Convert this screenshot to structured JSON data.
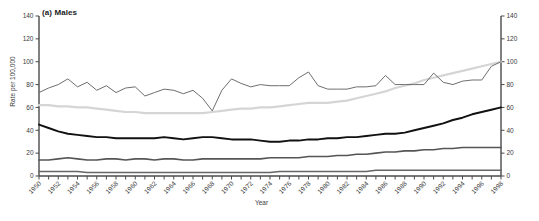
{
  "chart_data": {
    "type": "line",
    "title": "(a) Males",
    "xlabel": "Year",
    "ylabel": "Rate per 100,000",
    "xlim": [
      1950,
      1998
    ],
    "ylim": [
      0,
      140
    ],
    "ytick_values": [
      0,
      20,
      40,
      60,
      80,
      100,
      120,
      140
    ],
    "ytick_labels": [
      "0",
      "20",
      "40",
      "60",
      "80",
      "100",
      "120",
      "140"
    ],
    "right_axis": true,
    "right_ytick_labels": [
      "0",
      "20",
      "40",
      "60",
      "80",
      "100",
      "120",
      "140"
    ],
    "grid": false,
    "legend": "none",
    "x": [
      1950,
      1951,
      1952,
      1953,
      1954,
      1955,
      1956,
      1957,
      1958,
      1959,
      1960,
      1961,
      1962,
      1963,
      1964,
      1965,
      1966,
      1967,
      1968,
      1969,
      1970,
      1971,
      1972,
      1973,
      1974,
      1975,
      1976,
      1977,
      1978,
      1979,
      1980,
      1981,
      1982,
      1983,
      1984,
      1985,
      1986,
      1987,
      1988,
      1989,
      1990,
      1991,
      1992,
      1993,
      1994,
      1995,
      1996,
      1997,
      1998
    ],
    "xtick_values": [
      1950,
      1952,
      1954,
      1956,
      1958,
      1960,
      1962,
      1964,
      1966,
      1968,
      1970,
      1972,
      1974,
      1976,
      1978,
      1980,
      1982,
      1984,
      1986,
      1988,
      1990,
      1992,
      1994,
      1996,
      1998
    ],
    "xtick_labels": [
      "1950",
      "1952",
      "1954",
      "1956",
      "1958",
      "1960",
      "1962",
      "1964",
      "1966",
      "1968",
      "1970",
      "1972",
      "1974",
      "1976",
      "1978",
      "1980",
      "1982",
      "1984",
      "1986",
      "1988",
      "1990",
      "1992",
      "1994",
      "1996",
      "1998"
    ],
    "series": [
      {
        "name": "series-1-darkgray-volatile",
        "color": "#6e6e6e",
        "width": 1.0,
        "values": [
          73,
          77,
          80,
          85,
          78,
          82,
          75,
          79,
          73,
          77,
          78,
          70,
          73,
          76,
          75,
          72,
          75,
          68,
          57,
          75,
          85,
          81,
          78,
          80,
          79,
          79,
          79,
          86,
          91,
          79,
          76,
          76,
          76,
          78,
          78,
          79,
          88,
          80,
          80,
          80,
          80,
          90,
          82,
          80,
          83,
          84,
          84,
          96,
          100
        ]
      },
      {
        "name": "series-2-lightgray-smooth",
        "color": "#d5d5d5",
        "width": 2.2,
        "values": [
          62,
          62,
          61,
          61,
          60,
          60,
          59,
          58,
          57,
          56,
          56,
          55,
          55,
          55,
          55,
          55,
          55,
          55,
          56,
          57,
          58,
          59,
          59,
          60,
          60,
          61,
          62,
          63,
          64,
          64,
          64,
          65,
          66,
          68,
          70,
          72,
          74,
          77,
          79,
          81,
          84,
          86,
          88,
          90,
          92,
          94,
          96,
          98,
          100
        ]
      },
      {
        "name": "series-3-black-thick",
        "color": "#111111",
        "width": 1.9,
        "values": [
          45,
          42,
          39,
          37,
          36,
          35,
          34,
          34,
          33,
          33,
          33,
          33,
          33,
          34,
          33,
          32,
          33,
          34,
          34,
          33,
          32,
          32,
          32,
          31,
          30,
          30,
          31,
          31,
          32,
          32,
          33,
          33,
          34,
          34,
          35,
          36,
          37,
          37,
          38,
          40,
          42,
          44,
          46,
          49,
          51,
          54,
          56,
          58,
          60
        ]
      },
      {
        "name": "series-4-gray-mid",
        "color": "#555555",
        "width": 1.6,
        "values": [
          14,
          14,
          15,
          16,
          15,
          14,
          14,
          15,
          15,
          14,
          15,
          15,
          14,
          15,
          15,
          14,
          14,
          15,
          15,
          15,
          15,
          15,
          15,
          15,
          16,
          16,
          16,
          16,
          17,
          17,
          17,
          18,
          18,
          19,
          19,
          20,
          21,
          21,
          22,
          22,
          23,
          23,
          24,
          24,
          25,
          25,
          25,
          25,
          25
        ]
      },
      {
        "name": "series-5-gray-lowest",
        "color": "#666666",
        "width": 1.6,
        "values": [
          4,
          4,
          4,
          4,
          4,
          3,
          3,
          3,
          3,
          3,
          3,
          3,
          3,
          3,
          3,
          3,
          3,
          3,
          3,
          3,
          3,
          3,
          3,
          3,
          3,
          4,
          4,
          4,
          4,
          4,
          4,
          4,
          4,
          4,
          4,
          5,
          5,
          5,
          5,
          5,
          5,
          5,
          5,
          5,
          5,
          5,
          5,
          5,
          5
        ]
      }
    ]
  },
  "axis": {
    "left_axis_name": "left-y-axis",
    "right_axis_name": "right-y-axis",
    "bottom_axis_name": "x-axis"
  }
}
